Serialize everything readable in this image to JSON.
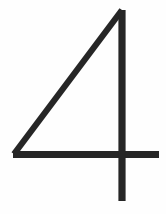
{
  "image": {
    "width": 166,
    "height": 214,
    "background_color": "#fefefe",
    "kind": "handwritten-digit-glyph",
    "alt_text": "4"
  },
  "glyph": {
    "character": "4",
    "name": "digit-four",
    "ink_color": "#262626",
    "style": "angular handwritten numeral, open-top four",
    "strokes": [
      {
        "name": "diagonal-stroke",
        "type": "line",
        "from": [
          122,
          10
        ],
        "to": [
          14,
          154
        ],
        "width": 6.2
      },
      {
        "name": "horizontal-stroke",
        "type": "line",
        "from": [
          13,
          154.5
        ],
        "to": [
          159,
          154.5
        ],
        "width": 7.0
      },
      {
        "name": "vertical-stroke",
        "type": "line",
        "from": [
          122,
          10
        ],
        "to": [
          122,
          201
        ],
        "width": 7.2
      }
    ],
    "bounds": {
      "left": 10,
      "top": 9,
      "right": 160,
      "bottom": 202
    }
  }
}
